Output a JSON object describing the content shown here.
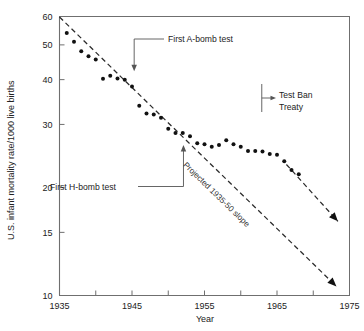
{
  "chart_data": {
    "type": "scatter",
    "title": "",
    "xlabel": "Year",
    "ylabel": "U.S. infant mortality rate/1000 live births",
    "xlim": [
      1935,
      1975
    ],
    "ylim": [
      10,
      60
    ],
    "yscale": "log",
    "grid": false,
    "legend": "none",
    "x_ticks": [
      1935,
      1940,
      1945,
      1950,
      1955,
      1960,
      1965,
      1970,
      1975
    ],
    "x_tick_labels": [
      "1935",
      "",
      "1945",
      "",
      "1955",
      "",
      "1965",
      "",
      "1975"
    ],
    "y_ticks": [
      10,
      15,
      20,
      30,
      40,
      50,
      60
    ],
    "y_tick_labels": [
      "10",
      "15",
      "20",
      "30",
      "40",
      "50",
      "60"
    ],
    "series": [
      {
        "name": "U.S. infant mortality rate",
        "x": [
          1936,
          1937,
          1938,
          1939,
          1940,
          1941,
          1942,
          1943,
          1944,
          1945,
          1946,
          1947,
          1948,
          1949,
          1950,
          1951,
          1952,
          1953,
          1954,
          1955,
          1956,
          1957,
          1958,
          1959,
          1960,
          1961,
          1962,
          1963,
          1964,
          1965,
          1966,
          1967,
          1968
        ],
        "y": [
          54.0,
          51.0,
          48.0,
          46.5,
          45.5,
          40.2,
          41.0,
          40.3,
          40.0,
          38.3,
          33.8,
          32.2,
          32.0,
          31.3,
          29.2,
          28.4,
          28.4,
          27.8,
          26.6,
          26.4,
          26.0,
          26.3,
          27.1,
          26.4,
          26.0,
          25.3,
          25.3,
          25.2,
          24.8,
          24.7,
          23.7,
          22.4,
          21.8
        ]
      }
    ],
    "annotations": [
      {
        "id": "a-bomb",
        "label": "First A-bomb test",
        "year": 1945
      },
      {
        "id": "h-bomb",
        "label": "First H-bomb test",
        "year": 1952
      },
      {
        "id": "test-ban",
        "label_line1": "Test Ban",
        "label_line2": "Treaty",
        "year": 1963
      },
      {
        "id": "projected-slope",
        "label": "Projected 1935-50 slope"
      }
    ]
  },
  "colors": {
    "ink": "#1a1a1a",
    "axis": "#6f6f6f",
    "dot": "#111111",
    "dash": "#2b2b2b",
    "leader": "#555555",
    "background": "#ffffff"
  }
}
